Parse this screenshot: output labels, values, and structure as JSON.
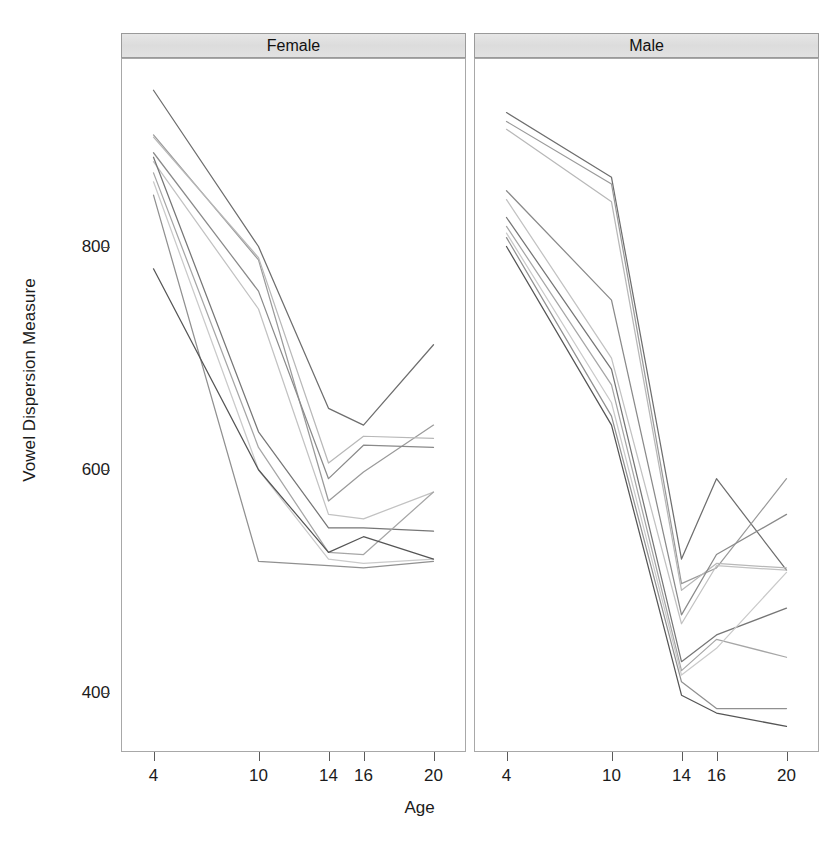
{
  "chart_data": {
    "type": "line",
    "title": "",
    "xlabel": "Age",
    "ylabel": "Vowel Dispersion Measure",
    "x_tick_values": [
      4,
      10,
      14,
      16,
      20
    ],
    "x_tick_labels": [
      "4",
      "10",
      "14",
      "16",
      "20"
    ],
    "y_tick_values": [
      400,
      600,
      800
    ],
    "y_tick_labels": [
      "400",
      "600",
      "800"
    ],
    "xlim": [
      2.2,
      21.8
    ],
    "ylim": [
      348,
      968
    ],
    "grid": false,
    "legend": "none",
    "facet_variable": "Sex",
    "facets": [
      {
        "label": "Female",
        "series": [
          {
            "name": "F01",
            "values": [
              940,
              800,
              655,
              640,
              712
            ]
          },
          {
            "name": "F02",
            "values": [
              900,
              788,
              572,
              598,
              640
            ]
          },
          {
            "name": "F03",
            "values": [
              898,
              790,
              606,
              630,
              628
            ]
          },
          {
            "name": "F04",
            "values": [
              884,
              760,
              592,
              622,
              620
            ]
          },
          {
            "name": "F05",
            "values": [
              876,
              744,
              560,
              556,
              580
            ]
          },
          {
            "name": "F06",
            "values": [
              880,
              634,
              548,
              548,
              545
            ]
          },
          {
            "name": "F07",
            "values": [
              866,
              620,
              526,
              524,
              580
            ]
          },
          {
            "name": "F08",
            "values": [
              858,
              600,
              520,
              516,
              520
            ]
          },
          {
            "name": "F09",
            "values": [
              846,
              518,
              514,
              512,
              518
            ]
          },
          {
            "name": "F10",
            "values": [
              780,
              600,
              526,
              540,
              520
            ]
          }
        ]
      },
      {
        "label": "Male",
        "series": [
          {
            "name": "M01",
            "values": [
              920,
              862,
              520,
              592,
              510
            ]
          },
          {
            "name": "M02",
            "values": [
              912,
              856,
              498,
              512,
              592
            ]
          },
          {
            "name": "M03",
            "values": [
              905,
              840,
              492,
              516,
              512
            ]
          },
          {
            "name": "M04",
            "values": [
              850,
              752,
              470,
              524,
              560
            ]
          },
          {
            "name": "M05",
            "values": [
              842,
              700,
              462,
              514,
              510
            ]
          },
          {
            "name": "M06",
            "values": [
              826,
              690,
              428,
              452,
              476
            ]
          },
          {
            "name": "M07",
            "values": [
              818,
              676,
              420,
              448,
              432
            ]
          },
          {
            "name": "M08",
            "values": [
              812,
              660,
              416,
              440,
              508
            ]
          },
          {
            "name": "M09",
            "values": [
              808,
              648,
              410,
              386,
              386
            ]
          },
          {
            "name": "M10",
            "values": [
              800,
              640,
              398,
              382,
              370
            ]
          }
        ]
      }
    ],
    "line_shades": [
      "#6e6e6e",
      "#9a9a9a",
      "#b8b8b8",
      "#8a8a8a",
      "#c2c2c2",
      "#767676",
      "#a6a6a6",
      "#cacaca",
      "#909090",
      "#555555"
    ]
  },
  "layout": {
    "panel_left": 121,
    "panel_right": 819,
    "panel_top": 33,
    "panel_bottom": 752,
    "strip_height": 25,
    "gap": 8
  }
}
